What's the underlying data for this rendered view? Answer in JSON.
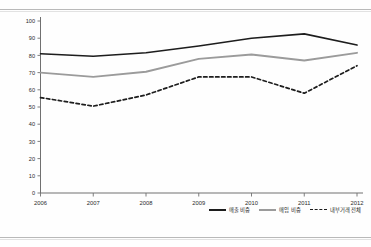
{
  "page": {
    "background_color": "#fefefe",
    "rule_color": "#b9b9b9"
  },
  "chart_data": {
    "type": "line",
    "title": "",
    "subtitle": "",
    "xlabel": "",
    "ylabel": "",
    "categories": [
      "2006",
      "2007",
      "2008",
      "2009",
      "2010",
      "2011",
      "2012"
    ],
    "x": [
      2006,
      2007,
      2008,
      2009,
      2010,
      2011,
      2012
    ],
    "ylim": [
      0,
      100
    ],
    "yticks": [
      0,
      10,
      20,
      30,
      40,
      50,
      60,
      70,
      80,
      90,
      100
    ],
    "ytick_labels": [
      "0",
      "10",
      "20",
      "30",
      "40",
      "50",
      "60",
      "70",
      "80",
      "90",
      "100"
    ],
    "grid": false,
    "legend_position": "bottom-right",
    "series": [
      {
        "name": "매출 비중",
        "style": "solid",
        "color": "#1d1d1d",
        "width": 1.6,
        "values": [
          81,
          79.5,
          81.5,
          85.5,
          90,
          92.5,
          86
        ]
      },
      {
        "name": "매입 비중",
        "style": "solid",
        "color": "#9b9b9b",
        "width": 1.9,
        "values": [
          70,
          67.5,
          70.5,
          78,
          80.5,
          77,
          81.5
        ]
      },
      {
        "name": "내부거래 전체",
        "style": "dashed",
        "color": "#1d1d1d",
        "width": 1.7,
        "values": [
          55.5,
          50.5,
          57,
          67.5,
          67.5,
          58,
          74
        ]
      }
    ]
  },
  "legend": {
    "items": [
      {
        "label": "매출 비중",
        "swatch": "solid-black"
      },
      {
        "label": "매입 비중",
        "swatch": "solid-gray"
      },
      {
        "label": "내부거래 전체",
        "swatch": "dashed"
      }
    ]
  },
  "axis": {
    "x_axis_name": "year-axis",
    "y_axis_name": "percent-axis"
  }
}
